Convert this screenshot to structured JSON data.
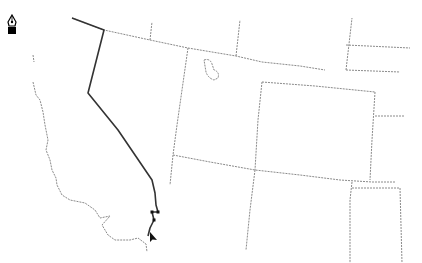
{
  "tool": {
    "icon": "pen-tool-icon",
    "active": true
  },
  "map": {
    "colors": {
      "background": "#ffffff",
      "state_border": "#8a8a8a",
      "drawn_path": "#333333",
      "cursor": "#111111"
    },
    "state_borders": [
      "M 72 18 L 104 30 L 150 40 L 188 48 L 236 56 L 262 62 L 300 66 L 325 70",
      "M 150 40 L 152 22",
      "M 188 48 L 182 90 L 177 125 L 173 155 L 170 185",
      "M 236 56 L 240 20",
      "M 346 70 L 352 18",
      "M 346 70 L 400 72",
      "M 346 45 L 410 48",
      "M 173 155 L 210 162 L 255 170 L 300 175 L 340 180 L 372 182 L 395 182",
      "M 262 82 L 258 120 L 255 170",
      "M 262 82 L 315 86 L 375 92",
      "M 375 92 L 372 140 L 370 180",
      "M 375 116 L 405 116",
      "M 255 170 L 250 210 L 246 250",
      "M 352 182 L 350 200 L 350 263",
      "M 352 188 L 400 188 L 402 263"
    ],
    "coastline": [
      "M 33 55 L 34 62",
      "M 33 82 L 36 95 L 40 100 L 43 112 L 45 125 L 48 140 L 46 150 L 50 160 L 52 170 L 56 178 L 57 185 L 62 195 L 70 200 L 85 203 L 95 210 L 100 218 L 110 216 L 102 225 L 108 235 L 115 240 L 130 240 L 138 238 L 146 244 L 147 252"
    ],
    "lakes": [
      "M 204 60 Q 210 58 212 64 L 214 70 Q 220 72 218 78 L 214 80 Q 208 78 206 72 Z"
    ],
    "drawn_path": "M 72 18 L 104 30 L 88 93 L 118 130 L 152 180 L 155 193 L 156 205 L 158 212 L 152 212 L 154 220 L 150 228 L 148 236",
    "path_vertices": [
      [
        152,
        212
      ],
      [
        158,
        212
      ],
      [
        154,
        220
      ]
    ],
    "cursor": {
      "x": 150,
      "y": 232
    }
  }
}
